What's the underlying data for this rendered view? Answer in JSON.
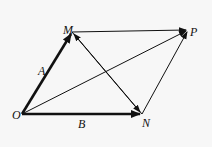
{
  "diagram": {
    "points": {
      "O": {
        "label": "O",
        "x": 22,
        "y": 114
      },
      "M": {
        "label": "M",
        "x": 72,
        "y": 32
      },
      "P": {
        "label": "P",
        "x": 188,
        "y": 30
      },
      "N": {
        "label": "N",
        "x": 142,
        "y": 114
      }
    },
    "vectors": [
      {
        "from": "O",
        "to": "M",
        "label": "A",
        "weight": "thick"
      },
      {
        "from": "O",
        "to": "N",
        "label": "B",
        "weight": "thick"
      },
      {
        "from": "M",
        "to": "P",
        "label": "",
        "weight": "thin"
      },
      {
        "from": "N",
        "to": "P",
        "label": "",
        "weight": "thin"
      },
      {
        "from": "O",
        "to": "P",
        "label": "",
        "weight": "thin"
      },
      {
        "from": "N",
        "to": "M",
        "label": "",
        "weight": "thin"
      }
    ],
    "labels": {
      "O": "O",
      "M": "M",
      "P": "P",
      "N": "N",
      "A": "A",
      "B": "B"
    },
    "colors": {
      "ink": "#111111",
      "background": "#f7f7f7"
    }
  }
}
